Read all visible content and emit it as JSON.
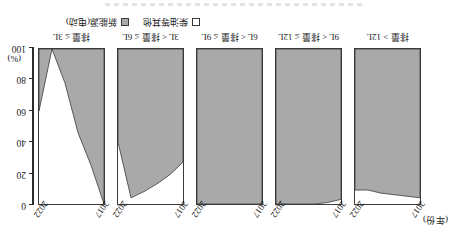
{
  "figure": {
    "year_axis_caption": "(年份)",
    "y_unit_label": "(%)",
    "rotation_note": "180"
  },
  "yaxis": {
    "ticks": [
      0,
      20,
      40,
      60,
      80,
      100
    ],
    "labels": [
      "0",
      "20",
      "40",
      "60",
      "80",
      "100"
    ],
    "min": 0,
    "max": 100
  },
  "xaxis": {
    "year_start_label": "2017",
    "year_end_label": "2022"
  },
  "legend": {
    "items": [
      {
        "key": "other_fuel",
        "label": "柴油等其他",
        "swatch": "open",
        "color": "#ffffff"
      },
      {
        "key": "new_energy",
        "label": "新能源(电动)",
        "swatch": "solid",
        "color": "#a9a9a9"
      }
    ]
  },
  "colors": {
    "fill_gray": "#a9a9a9",
    "fill_white": "#ffffff",
    "stroke": "#3a3a3a",
    "axis": "#2b2b2b",
    "text": "#1a1a1a"
  },
  "chart_data": {
    "type": "area",
    "title": "",
    "subtitle": "",
    "xlabel": "(年份)",
    "ylabel": "(%)",
    "ylim": [
      0,
      100
    ],
    "grid": false,
    "legend_position": "bottom-right",
    "stacked": true,
    "orientation": "rotated-180",
    "x": [
      2017,
      2018,
      2019,
      2020,
      2021,
      2022
    ],
    "xtick_labels": [
      "2017",
      "2022"
    ],
    "panels": [
      {
        "name": "排量 ≤ 3L",
        "category": "排量 ≤ 3L",
        "series": [
          {
            "name": "新能源(电动)",
            "values": [
              0,
              25,
              46,
              78,
              100,
              60
            ]
          },
          {
            "name": "柴油等其他",
            "values": [
              100,
              75,
              54,
              22,
              0,
              40
            ]
          }
        ]
      },
      {
        "name": "3L < 排量 ≤ 6L",
        "category": "3L < 排量 ≤ 6L",
        "series": [
          {
            "name": "新能源(电动)",
            "values": [
              27,
              19,
              13,
              8,
              4,
              40
            ]
          },
          {
            "name": "柴油等其他",
            "values": [
              73,
              81,
              87,
              92,
              96,
              60
            ]
          }
        ]
      },
      {
        "name": "6L < 排量 ≤ 9L",
        "category": "6L < 排量 ≤ 9L",
        "series": [
          {
            "name": "新能源(电动)",
            "values": [
              0,
              0,
              0,
              0,
              0,
              0
            ]
          },
          {
            "name": "柴油等其他",
            "values": [
              100,
              100,
              100,
              100,
              100,
              100
            ]
          }
        ]
      },
      {
        "name": "9L < 排量 ≤ 12L",
        "category": "9L < 排量 ≤ 12L",
        "series": [
          {
            "name": "新能源(电动)",
            "values": [
              3,
              1,
              0,
              0,
              0,
              0
            ]
          },
          {
            "name": "柴油等其他",
            "values": [
              97,
              99,
              100,
              100,
              100,
              100
            ]
          }
        ]
      },
      {
        "name": "排量 > 12L",
        "category": "排量 > 12L",
        "series": [
          {
            "name": "新能源(电动)",
            "values": [
              4,
              5,
              6,
              7,
              9,
              9
            ]
          },
          {
            "name": "柴油等其他",
            "values": [
              96,
              95,
              94,
              93,
              91,
              91
            ]
          }
        ]
      }
    ]
  }
}
